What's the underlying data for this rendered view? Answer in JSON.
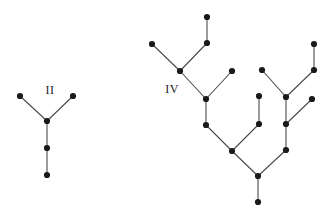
{
  "figure": {
    "width": 332,
    "height": 215,
    "background": "#ffffff",
    "edge_color": "#4a4a4a",
    "node_color": "#1a1a1a",
    "node_radius": 3.1,
    "edge_width": 1.1
  },
  "trees": [
    {
      "id": "tree-ii",
      "label": "II",
      "label_pos": {
        "x": 50,
        "y": 91
      },
      "nodes": [
        {
          "id": "n1",
          "x": 20,
          "y": 96
        },
        {
          "id": "n2",
          "x": 73,
          "y": 96
        },
        {
          "id": "n3",
          "x": 47,
          "y": 121
        },
        {
          "id": "n4",
          "x": 47,
          "y": 148
        },
        {
          "id": "n5",
          "x": 47,
          "y": 175
        }
      ],
      "edges": [
        [
          "n1",
          "n3"
        ],
        [
          "n2",
          "n3"
        ],
        [
          "n3",
          "n4"
        ],
        [
          "n4",
          "n5"
        ]
      ]
    },
    {
      "id": "tree-iv",
      "label": "IV",
      "label_pos": {
        "x": 172,
        "y": 90
      },
      "nodes": [
        {
          "id": "m01",
          "x": 152,
          "y": 44
        },
        {
          "id": "m02",
          "x": 207,
          "y": 17
        },
        {
          "id": "m03",
          "x": 207,
          "y": 43
        },
        {
          "id": "m04",
          "x": 180,
          "y": 71
        },
        {
          "id": "m05",
          "x": 232,
          "y": 71
        },
        {
          "id": "m06",
          "x": 206,
          "y": 99
        },
        {
          "id": "m07",
          "x": 206,
          "y": 125
        },
        {
          "id": "m08",
          "x": 259,
          "y": 96
        },
        {
          "id": "m09",
          "x": 259,
          "y": 124
        },
        {
          "id": "m10",
          "x": 232,
          "y": 151
        },
        {
          "id": "m11",
          "x": 262,
          "y": 70
        },
        {
          "id": "m12",
          "x": 314,
          "y": 44
        },
        {
          "id": "m13",
          "x": 314,
          "y": 70
        },
        {
          "id": "m14",
          "x": 286,
          "y": 97
        },
        {
          "id": "m15",
          "x": 312,
          "y": 99
        },
        {
          "id": "m16",
          "x": 286,
          "y": 124
        },
        {
          "id": "m17",
          "x": 286,
          "y": 150
        },
        {
          "id": "m18",
          "x": 258,
          "y": 176
        },
        {
          "id": "m19",
          "x": 258,
          "y": 202
        }
      ],
      "edges": [
        [
          "m01",
          "m04"
        ],
        [
          "m02",
          "m03"
        ],
        [
          "m03",
          "m04"
        ],
        [
          "m04",
          "m06"
        ],
        [
          "m05",
          "m06"
        ],
        [
          "m06",
          "m07"
        ],
        [
          "m07",
          "m10"
        ],
        [
          "m08",
          "m09"
        ],
        [
          "m09",
          "m10"
        ],
        [
          "m10",
          "m18"
        ],
        [
          "m11",
          "m14"
        ],
        [
          "m12",
          "m13"
        ],
        [
          "m13",
          "m14"
        ],
        [
          "m14",
          "m16"
        ],
        [
          "m15",
          "m16"
        ],
        [
          "m16",
          "m17"
        ],
        [
          "m17",
          "m18"
        ],
        [
          "m18",
          "m19"
        ]
      ]
    }
  ]
}
